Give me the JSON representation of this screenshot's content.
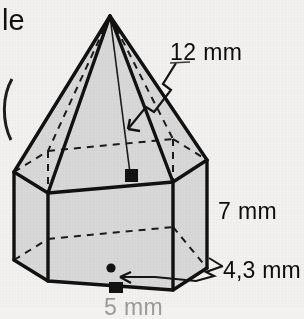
{
  "figure": {
    "kind": "hexagonal-prism-with-pyramid",
    "background_color": "#f2f1ef",
    "face_fill_color": "#d8d8d8",
    "outline_color": "#111111",
    "hidden_edge_style": "dashed"
  },
  "labels": {
    "pyramid_height": "12 mm",
    "prism_height": "7 mm",
    "apothem": "4,3 mm",
    "base_edge": "5 mm",
    "text_fragment": "le"
  },
  "markers": {
    "right_angle_top": "right-angle-marker",
    "right_angle_bottom": "right-angle-marker",
    "center_point": "base-center-dot"
  }
}
